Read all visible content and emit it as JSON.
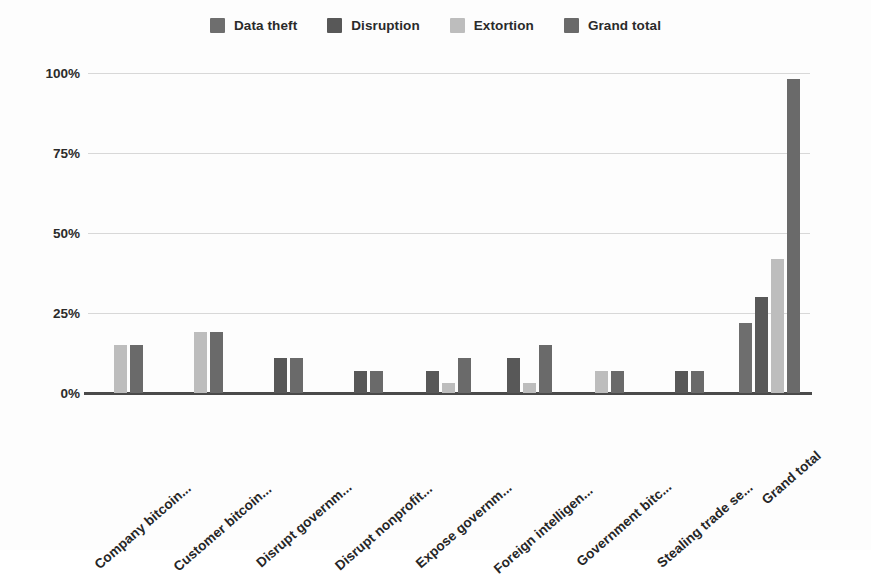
{
  "chart_data": {
    "type": "bar",
    "title": "",
    "subtitle": "",
    "xlabel": "",
    "ylabel": "",
    "ylim": [
      0,
      100
    ],
    "ytick_labels": [
      "0%",
      "25%",
      "50%",
      "75%",
      "100%"
    ],
    "ytick_values": [
      0,
      25,
      50,
      75,
      100
    ],
    "grid": true,
    "legend_position": "top-center",
    "value_unit": "%",
    "categories": [
      "Company bitcoin...",
      "Customer bitcoin...",
      "Disrupt governm...",
      "Disrupt nonprofit...",
      "Expose governm...",
      "Foreign intelligen...",
      "Government bitc...",
      "Stealing trade se...",
      "Grand total"
    ],
    "series": [
      {
        "name": "Data theft",
        "color": "#6e6e6e",
        "values": [
          null,
          null,
          null,
          null,
          null,
          null,
          null,
          null,
          22
        ]
      },
      {
        "name": "Disruption",
        "color": "#585858",
        "values": [
          null,
          null,
          11,
          7,
          7,
          11,
          null,
          7,
          30
        ]
      },
      {
        "name": "Extortion",
        "color": "#bdbdbd",
        "values": [
          15,
          19,
          null,
          null,
          3,
          3,
          7,
          null,
          42
        ]
      },
      {
        "name": "Grand total",
        "color": "#6a6a6a",
        "values": [
          15,
          19,
          11,
          7,
          11,
          15,
          7,
          7,
          98
        ]
      }
    ]
  },
  "legend": {
    "items": [
      {
        "label": "Data theft",
        "color": "#6e6e6e"
      },
      {
        "label": "Disruption",
        "color": "#585858"
      },
      {
        "label": "Extortion",
        "color": "#bdbdbd"
      },
      {
        "label": "Grand total",
        "color": "#6a6a6a"
      }
    ]
  },
  "colors": {
    "gridline": "#d8d8d8",
    "axis": "#4a4a4a",
    "text": "#262626",
    "background": "#fdfdfd"
  }
}
